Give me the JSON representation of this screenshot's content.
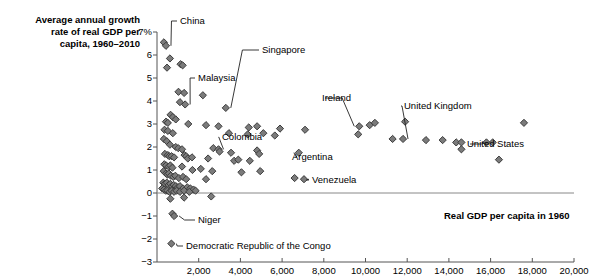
{
  "chart_data": {
    "type": "scatter",
    "title_lines": [
      "Average annual growth",
      "rate of real GDP per",
      "capita, 1960–2010"
    ],
    "xlabel": "Real GDP per capita in 1960",
    "ylabel": "",
    "xlim": [
      0,
      20000
    ],
    "ylim": [
      -3,
      7
    ],
    "grid": false,
    "legend": "none",
    "xticks": [
      2000,
      4000,
      6000,
      8000,
      10000,
      12000,
      14000,
      16000,
      18000,
      20000
    ],
    "xtick_labels": [
      "2,000",
      "4,000",
      "6,000",
      "8,000",
      "10,000",
      "12,000",
      "14,000",
      "16,000",
      "18,000",
      "20,000"
    ],
    "yticks": [
      7,
      6,
      5,
      4,
      3,
      2,
      1,
      0,
      -1,
      -2,
      -3
    ],
    "ytick_labels": [
      "7%",
      "6",
      "5",
      "4",
      "3",
      "2",
      "1",
      "0",
      "−1",
      "−2",
      "−3"
    ],
    "marker": "diamond",
    "marker_color": "#7b7b7b",
    "marker_edge_color": "#3c3c3c",
    "points": [
      [
        330,
        6.55
      ],
      [
        430,
        6.4
      ],
      [
        620,
        5.85
      ],
      [
        1130,
        5.6
      ],
      [
        1230,
        5.55
      ],
      [
        480,
        5.45
      ],
      [
        1030,
        4.4
      ],
      [
        1300,
        4.35
      ],
      [
        2200,
        4.25
      ],
      [
        1100,
        3.95
      ],
      [
        1350,
        3.85
      ],
      [
        3300,
        3.7
      ],
      [
        650,
        3.4
      ],
      [
        760,
        3.3
      ],
      [
        900,
        3.2
      ],
      [
        430,
        3.1
      ],
      [
        520,
        3.05
      ],
      [
        1500,
        3.0
      ],
      [
        2350,
        2.95
      ],
      [
        2950,
        2.9
      ],
      [
        4400,
        2.85
      ],
      [
        4800,
        2.9
      ],
      [
        5900,
        2.8
      ],
      [
        7100,
        2.75
      ],
      [
        9700,
        2.9
      ],
      [
        10200,
        2.95
      ],
      [
        10450,
        3.05
      ],
      [
        11900,
        3.1
      ],
      [
        17600,
        3.05
      ],
      [
        360,
        2.75
      ],
      [
        520,
        2.7
      ],
      [
        760,
        2.6
      ],
      [
        3450,
        2.6
      ],
      [
        4350,
        2.55
      ],
      [
        5100,
        2.6
      ],
      [
        5650,
        2.5
      ],
      [
        9650,
        2.55
      ],
      [
        11300,
        2.35
      ],
      [
        11800,
        2.35
      ],
      [
        12900,
        2.3
      ],
      [
        13700,
        2.3
      ],
      [
        14350,
        2.2
      ],
      [
        14600,
        2.2
      ],
      [
        15800,
        2.2
      ],
      [
        16100,
        2.2
      ],
      [
        330,
        2.35
      ],
      [
        470,
        2.25
      ],
      [
        620,
        2.1
      ],
      [
        900,
        2.0
      ],
      [
        1020,
        1.95
      ],
      [
        1200,
        1.9
      ],
      [
        2700,
        1.95
      ],
      [
        2950,
        1.9
      ],
      [
        3000,
        1.8
      ],
      [
        3550,
        1.75
      ],
      [
        4800,
        1.85
      ],
      [
        4900,
        1.7
      ],
      [
        6800,
        1.75
      ],
      [
        14600,
        1.9
      ],
      [
        380,
        1.7
      ],
      [
        520,
        1.65
      ],
      [
        590,
        1.6
      ],
      [
        700,
        1.6
      ],
      [
        820,
        1.55
      ],
      [
        1320,
        1.65
      ],
      [
        1400,
        1.6
      ],
      [
        1480,
        1.5
      ],
      [
        1680,
        1.55
      ],
      [
        2450,
        1.5
      ],
      [
        3700,
        1.4
      ],
      [
        3900,
        1.45
      ],
      [
        4450,
        1.4
      ],
      [
        16400,
        1.45
      ],
      [
        350,
        1.25
      ],
      [
        440,
        1.2
      ],
      [
        560,
        1.15
      ],
      [
        640,
        1.2
      ],
      [
        740,
        1.1
      ],
      [
        1200,
        1.15
      ],
      [
        1700,
        1.0
      ],
      [
        2100,
        1.05
      ],
      [
        2650,
        0.95
      ],
      [
        4050,
        0.9
      ],
      [
        4950,
        0.95
      ],
      [
        320,
        0.95
      ],
      [
        430,
        0.85
      ],
      [
        500,
        0.8
      ],
      [
        570,
        0.85
      ],
      [
        660,
        0.75
      ],
      [
        780,
        0.7
      ],
      [
        880,
        0.75
      ],
      [
        1050,
        0.65
      ],
      [
        1250,
        0.7
      ],
      [
        1400,
        0.6
      ],
      [
        2350,
        0.6
      ],
      [
        6600,
        0.65
      ],
      [
        7050,
        0.6
      ],
      [
        300,
        0.45
      ],
      [
        380,
        0.4
      ],
      [
        470,
        0.45
      ],
      [
        560,
        0.35
      ],
      [
        640,
        0.4
      ],
      [
        720,
        0.3
      ],
      [
        800,
        0.35
      ],
      [
        900,
        0.3
      ],
      [
        1000,
        0.25
      ],
      [
        1100,
        0.3
      ],
      [
        1250,
        0.2
      ],
      [
        1450,
        0.25
      ],
      [
        1600,
        0.2
      ],
      [
        1750,
        0.15
      ],
      [
        250,
        0.2
      ],
      [
        340,
        0.15
      ],
      [
        420,
        0.1
      ],
      [
        500,
        0.1
      ],
      [
        600,
        0.05
      ],
      [
        700,
        0.1
      ],
      [
        820,
        0.05
      ],
      [
        940,
        0.1
      ],
      [
        1100,
        0.05
      ],
      [
        1300,
        0.1
      ],
      [
        1550,
        0.05
      ],
      [
        1850,
        0.1
      ],
      [
        640,
        -0.25
      ],
      [
        1300,
        -0.2
      ],
      [
        2600,
        -0.15
      ],
      [
        740,
        -0.9
      ],
      [
        820,
        -1.0
      ],
      [
        690,
        -2.2
      ]
    ],
    "annotations": [
      {
        "label": "China",
        "x": 430,
        "y": 6.4,
        "text_x": 180,
        "text_y": 15,
        "leader": true
      },
      {
        "label": "Singapore",
        "x": 3300,
        "y": 3.7,
        "text_x": 262,
        "text_y": 44,
        "leader": true
      },
      {
        "label": "Malaysia",
        "x": 1350,
        "y": 3.85,
        "text_x": 198,
        "text_y": 72,
        "leader": true
      },
      {
        "label": "Ireland",
        "x": 9700,
        "y": 2.9,
        "text_x": 322,
        "text_y": 92,
        "leader": true
      },
      {
        "label": "United Kingdom",
        "x": 11800,
        "y": 2.35,
        "text_x": 404,
        "text_y": 100,
        "leader": true
      },
      {
        "label": "United States",
        "x": 16100,
        "y": 2.2,
        "text_x": 467,
        "text_y": 138,
        "leader": true
      },
      {
        "label": "Colombia",
        "x": 2950,
        "y": 1.9,
        "text_x": 222,
        "text_y": 131,
        "leader": true
      },
      {
        "label": "Argentina",
        "x": 6800,
        "y": 1.75,
        "text_x": 292,
        "text_y": 151,
        "leader": true
      },
      {
        "label": "Venezuela",
        "x": 7050,
        "y": 0.6,
        "text_x": 312,
        "text_y": 174,
        "leader": true
      },
      {
        "label": "Niger",
        "x": 820,
        "y": -1.0,
        "text_x": 198,
        "text_y": 214,
        "leader": true
      },
      {
        "label": "Democratic Republic of the Congo",
        "x": 690,
        "y": -2.2,
        "text_x": 186,
        "text_y": 240,
        "leader": true
      }
    ]
  }
}
